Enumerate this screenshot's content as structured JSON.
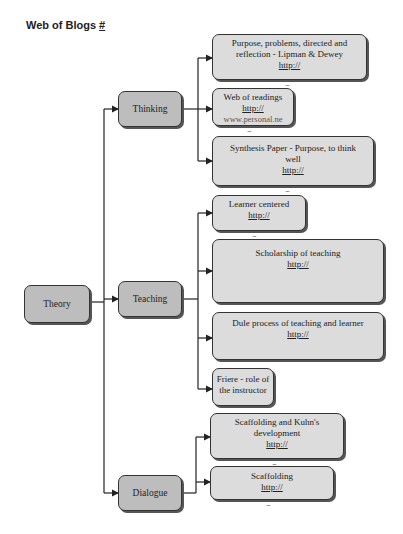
{
  "title": "Web of Blogs",
  "title_link": "#",
  "root": {
    "label": "Theory"
  },
  "branches": [
    {
      "label": "Thinking",
      "children": [
        {
          "text": "Purpose, problems, directed and reflection - Lipman & Dewey",
          "link": "http://"
        },
        {
          "text": "Web of readings",
          "link": "http://",
          "clipped": "www.personal.ne"
        },
        {
          "text": "Synthesis Paper - Purpose, to think well",
          "link": "http://"
        }
      ]
    },
    {
      "label": "Teaching",
      "children": [
        {
          "text": "Learner centered",
          "link": "http://"
        },
        {
          "text": "Scholarship of teaching",
          "link": "http://"
        },
        {
          "text": "Dule process of teaching and learner",
          "link": "http://"
        },
        {
          "text": "Friere - role of the instructor",
          "link": ""
        }
      ]
    },
    {
      "label": "Dialogue",
      "children": [
        {
          "text": "Scaffolding and Kuhn's development",
          "link": "http://"
        },
        {
          "text": "Scaffolding",
          "link": "http://"
        }
      ]
    }
  ],
  "more_marker": "..."
}
